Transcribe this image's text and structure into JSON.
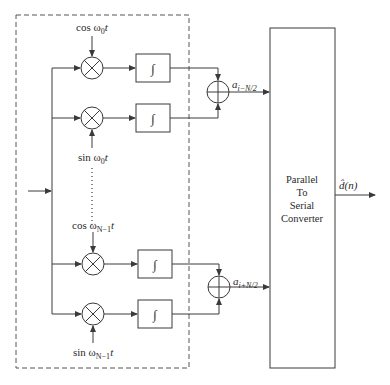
{
  "diagram": {
    "branches": [
      {
        "carrier_label": "cos ω",
        "subscript": "0",
        "suffix": "t",
        "position": "above",
        "integrator": "∫"
      },
      {
        "carrier_label": "sin ω",
        "subscript": "0",
        "suffix": "t",
        "position": "below",
        "integrator": "∫"
      },
      {
        "carrier_label": "cos ω",
        "subscript": "N−1",
        "suffix": "t",
        "position": "above",
        "integrator": "∫"
      },
      {
        "carrier_label": "sin ω",
        "subscript": "N−1",
        "suffix": "t",
        "position": "below",
        "integrator": "∫"
      }
    ],
    "adder_outputs": [
      {
        "label": "a",
        "subscript": "i−N/2"
      },
      {
        "label": "a",
        "subscript": "i+N/2"
      }
    ],
    "converter": {
      "lines": [
        "Parallel",
        "To",
        "Serial",
        "Converter"
      ]
    },
    "output": {
      "label": "d̂(n)"
    },
    "ellipsis": "⋮",
    "colors": {
      "line": "#3a3a3a",
      "text": "#2a2a2a",
      "background": "#ffffff"
    }
  }
}
